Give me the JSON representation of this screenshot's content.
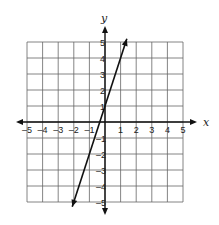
{
  "chart_data": {
    "type": "line",
    "title": "",
    "xlabel": "x",
    "ylabel": "y",
    "xlim": [
      -5,
      5
    ],
    "ylim": [
      -5,
      5
    ],
    "grid": true,
    "x_ticks": [
      "-5",
      "-4",
      "-3",
      "-2",
      "-1",
      "1",
      "2",
      "3",
      "4",
      "5"
    ],
    "y_ticks": [
      "5",
      "4",
      "3",
      "2",
      "1",
      "-1",
      "-2",
      "-3",
      "-4",
      "-5"
    ],
    "series": [
      {
        "name": "line",
        "equation": "y = 3x + 1",
        "slope": 3,
        "y_intercept": 1,
        "points": [
          [
            -2,
            -5
          ],
          [
            -1,
            -2
          ],
          [
            0,
            1
          ],
          [
            1,
            4
          ]
        ],
        "arrows_both_ends": true
      }
    ],
    "colors": {
      "line": "#222222",
      "grid": "#555555"
    }
  },
  "labels": {
    "x_axis": "x",
    "y_axis": "y"
  }
}
